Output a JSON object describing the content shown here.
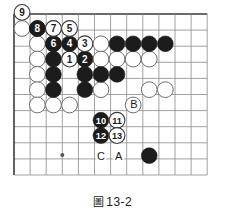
{
  "figure": {
    "caption_glyph": "圖",
    "caption_number": "13-2",
    "caption_full": "圖 13-2"
  },
  "board": {
    "type": "go-board-diagram",
    "line_color": "#8a8a8a",
    "border_color": "#3a3a3a",
    "background": "#ffffff",
    "black_color": "#1c1c1c",
    "white_color": "#ffffff",
    "white_edge_color": "#6e6e6e",
    "origin_x": 14,
    "origin_y": 14,
    "spacing": 16.1,
    "cols": 13,
    "rows": 11,
    "stone_radius": 7.9,
    "star_points": [
      {
        "col": 3,
        "row": 8.75
      }
    ]
  },
  "stones": {
    "black_plain": [
      {
        "col": 1.45,
        "row": 0.9
      },
      {
        "col": 2.45,
        "row": 0.9
      },
      {
        "col": 2.45,
        "row": 1.85
      },
      {
        "col": 2.45,
        "row": 2.8
      },
      {
        "col": 2.45,
        "row": 3.75
      },
      {
        "col": 2.45,
        "row": 4.7
      },
      {
        "col": 4.4,
        "row": 4.7
      },
      {
        "col": 4.4,
        "row": 3.75
      },
      {
        "col": 5.4,
        "row": 3.75
      },
      {
        "col": 6.4,
        "row": 3.75
      },
      {
        "col": 6.4,
        "row": 1.85
      },
      {
        "col": 7.4,
        "row": 1.85
      },
      {
        "col": 8.4,
        "row": 1.85
      },
      {
        "col": 9.4,
        "row": 1.85
      },
      {
        "col": 8.4,
        "row": 8.8
      }
    ],
    "white_plain": [
      {
        "col": 0.5,
        "row": 0.9
      },
      {
        "col": 1.45,
        "row": 1.85
      },
      {
        "col": 1.45,
        "row": 2.8
      },
      {
        "col": 1.45,
        "row": 3.75
      },
      {
        "col": 1.45,
        "row": 4.7
      },
      {
        "col": 1.45,
        "row": 5.65
      },
      {
        "col": 2.45,
        "row": 5.65
      },
      {
        "col": 3.45,
        "row": 5.65
      },
      {
        "col": 5.4,
        "row": 1.85
      },
      {
        "col": 4.4,
        "row": 2.8
      },
      {
        "col": 5.4,
        "row": 2.8
      },
      {
        "col": 6.4,
        "row": 2.8
      },
      {
        "col": 7.4,
        "row": 2.8
      },
      {
        "col": 8.4,
        "row": 2.8
      },
      {
        "col": 5.4,
        "row": 4.7
      },
      {
        "col": 8.4,
        "row": 4.7
      },
      {
        "col": 7.4,
        "row": 5.65
      },
      {
        "col": 9.4,
        "row": 4.7
      }
    ],
    "numbered": [
      {
        "n": "1",
        "color": "white",
        "col": 3.45,
        "row": 2.8
      },
      {
        "n": "2",
        "color": "black",
        "col": 4.4,
        "row": 2.8
      },
      {
        "n": "3",
        "color": "white",
        "col": 4.4,
        "row": 1.85
      },
      {
        "n": "4",
        "color": "black",
        "col": 3.45,
        "row": 1.85
      },
      {
        "n": "5",
        "color": "white",
        "col": 3.45,
        "row": 0.9
      },
      {
        "n": "6",
        "color": "black",
        "col": 2.45,
        "row": 1.85
      },
      {
        "n": "7",
        "color": "white",
        "col": 2.45,
        "row": 0.9
      },
      {
        "n": "8",
        "color": "black",
        "col": 1.45,
        "row": 0.9
      },
      {
        "n": "9",
        "color": "white",
        "col": 0.5,
        "row": -0.1
      },
      {
        "n": "10",
        "color": "black",
        "col": 5.4,
        "row": 6.6
      },
      {
        "n": "11",
        "color": "white",
        "col": 6.4,
        "row": 6.6
      },
      {
        "n": "12",
        "color": "black",
        "col": 5.4,
        "row": 7.55
      },
      {
        "n": "13",
        "color": "white",
        "col": 6.4,
        "row": 7.55
      }
    ]
  },
  "labels": [
    {
      "text": "B",
      "col": 7.45,
      "row": 5.6
    },
    {
      "text": "C",
      "col": 5.4,
      "row": 8.8
    },
    {
      "text": "A",
      "col": 6.5,
      "row": 8.8
    }
  ]
}
